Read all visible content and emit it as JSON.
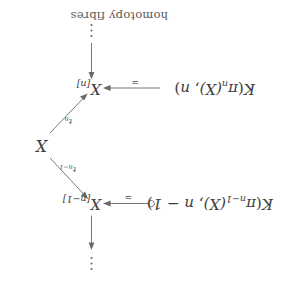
{
  "figure": {
    "type": "commutative-diagram",
    "orientation": "rotated-180",
    "background_color": "#ffffff",
    "ink_color": "#4a4a4a",
    "nodes": {
      "k_pi_n": {
        "label": "K(πn(X), n)",
        "parts": {
          "K": "K",
          "open": "(",
          "pi": "π",
          "sub1": "n",
          "of_x": "(X)",
          "comma": ", ",
          "deg": "n",
          "close": ")"
        }
      },
      "k_pi_nm1": {
        "label": "K(πn−1(X), n − 1)",
        "parts": {
          "K": "K",
          "open": "(",
          "pi": "π",
          "sub1": "n−1",
          "of_x": "(X)",
          "comma": ", ",
          "deg": "n − 1",
          "close": ")"
        }
      },
      "x_n": {
        "label": "X[n]",
        "base": "X",
        "index": "[n]"
      },
      "x_nm1": {
        "label": "X[n−1]",
        "base": "X",
        "index": "[n−1]"
      },
      "x": {
        "label": "X"
      }
    },
    "arrow_labels": {
      "equiv_top": "≃",
      "equiv_bottom": "≃",
      "t_n": {
        "base": "t",
        "sub": "n"
      },
      "t_nm1": {
        "base": "t",
        "sub": "n−1"
      }
    },
    "annotations": {
      "homotopy_fibres": "homotopy fibres"
    },
    "ellipsis": {
      "top": "⋮",
      "bottom": "⋮"
    }
  }
}
